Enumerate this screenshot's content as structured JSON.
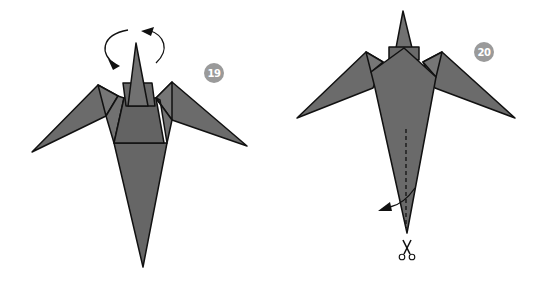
{
  "figure": {
    "type": "origami instruction diagram",
    "colors": {
      "paper_fill": "#6b6b6b",
      "paper_fill_dark": "#5e5e5e",
      "paper_fill_light": "#767676",
      "outline": "#111111",
      "badge": "#9a9a9a",
      "background": "#ffffff"
    }
  },
  "steps": [
    {
      "number": "19",
      "instruction_symbol": "rotate/turn-over arrows",
      "description": "Bird model with curved arrows above the head indicating turning the model over"
    },
    {
      "number": "20",
      "instruction_symbol": "scissors cut along dashed line, then fold tail flap aside",
      "description": "Bird model viewed from other side; dashed cut line on tail with scissors icon below and curved arrow"
    }
  ]
}
